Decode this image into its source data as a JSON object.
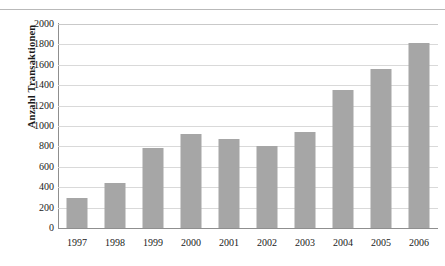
{
  "page": {
    "top_ghost_text": "",
    "top_rule_color": "#b9b9b9"
  },
  "chart_data": {
    "type": "bar",
    "title": "",
    "xlabel": "",
    "ylabel": "Anzahl Transaktionen",
    "categories": [
      "1997",
      "1998",
      "1999",
      "2000",
      "2001",
      "2002",
      "2003",
      "2004",
      "2005",
      "2006"
    ],
    "values": [
      290,
      440,
      780,
      920,
      870,
      800,
      940,
      1350,
      1560,
      1810
    ],
    "ylim": [
      0,
      2000
    ],
    "ytick_step": 200,
    "yticks": [
      0,
      200,
      400,
      600,
      800,
      1000,
      1200,
      1400,
      1600,
      1800,
      2000
    ],
    "ytick_labels": [
      "0",
      "200",
      "400",
      "600",
      "800",
      "1000",
      "1200",
      "1400",
      "1600",
      "1800",
      "2000"
    ],
    "grid": true,
    "legend": false,
    "legend_position": "none",
    "series": [
      {
        "name": "Anzahl Transaktionen",
        "color": "#a6a6a6",
        "values": [
          290,
          440,
          780,
          920,
          870,
          800,
          940,
          1350,
          1560,
          1810
        ]
      }
    ],
    "colors": {
      "bar": "#a6a6a6",
      "gridline": "#d9d9d9",
      "axis": "#8f8f8f",
      "background": "#ffffff",
      "text": "#1a1a1a"
    }
  }
}
